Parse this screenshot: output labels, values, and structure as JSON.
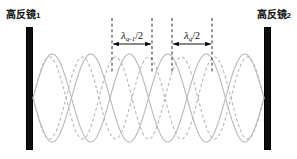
{
  "figure": {
    "type": "optical-cavity-longitudinal-modes-diagram",
    "background_color": "#ffffff",
    "width": 297,
    "height": 159
  },
  "mirrors": {
    "left": {
      "label_text": "高反镜",
      "label_index": "1",
      "name": "high-reflectivity-mirror-1",
      "color": "#0d0d0d",
      "x": 26,
      "y": 27,
      "width": 7,
      "height": 123
    },
    "right": {
      "label_text": "高反镜",
      "label_index": "2",
      "name": "high-reflectivity-mirror-2",
      "color": "#0d0d0d",
      "x": 264,
      "y": 27,
      "width": 7,
      "height": 123
    }
  },
  "waves": {
    "solid": {
      "name": "standing-wave-mode-q",
      "style": "solid",
      "color": "#b9b9b9",
      "half_wavelengths": 6,
      "amplitude": 44,
      "axis_y": 98,
      "x_start": 33,
      "x_end": 264
    },
    "dashed": {
      "name": "standing-wave-mode-q-minus-1",
      "style": "dashed",
      "color": "#b9b9b9",
      "half_wavelengths": 7,
      "amplitude": 41,
      "axis_y": 98,
      "x_start": 33,
      "x_end": 264
    }
  },
  "measurements": [
    {
      "name": "half-wavelength-q-minus-1",
      "lambda_symbol": "λ",
      "subscript": "q-1",
      "divisor": "/2",
      "label_full": "λq-1/2",
      "x_left": 112,
      "x_right": 152,
      "arrow_y": 44,
      "guide_top": 18,
      "guide_bottom": 72
    },
    {
      "name": "half-wavelength-q",
      "lambda_symbol": "λ",
      "subscript": "q",
      "divisor": "/2",
      "label_full": "λq/2",
      "x_left": 172,
      "x_right": 212,
      "arrow_y": 44,
      "guide_top": 18,
      "guide_bottom": 72
    }
  ],
  "colors": {
    "mirror": "#0d0d0d",
    "wave": "#b9b9b9",
    "annotation": "#0a0a0a",
    "guide": "#1a1a1a"
  }
}
